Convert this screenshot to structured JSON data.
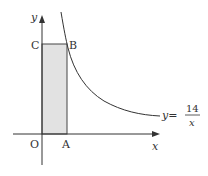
{
  "diagram": {
    "equation": {
      "lhs": "y=",
      "numerator": "14",
      "denominator": "x"
    },
    "axes": {
      "x_label": "x",
      "y_label": "y",
      "origin_label": "O"
    },
    "points": {
      "A": "A",
      "B": "B",
      "C": "C"
    },
    "colors": {
      "stroke": "#333333",
      "fill": "#e0e0e0",
      "background": "#ffffff"
    }
  }
}
